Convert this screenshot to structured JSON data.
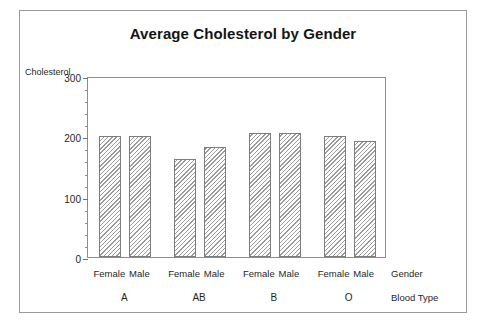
{
  "chart_data": {
    "type": "bar",
    "title": "Average Cholesterol by Gender",
    "xlabel": "Blood Type",
    "ylabel": "Cholesterol",
    "grid": false,
    "legend": "none",
    "ylim": [
      0,
      300
    ],
    "yticks": [
      0,
      100,
      200,
      300
    ],
    "ytick_labels": [
      "0",
      "100",
      "200",
      "300"
    ],
    "group_axis_name": "Blood Type",
    "subgroup_axis_name": "Gender",
    "categories": [
      "A",
      "AB",
      "B",
      "O"
    ],
    "subcategories": [
      "Female",
      "Male"
    ],
    "series": [
      {
        "name": "Female",
        "values": [
          200,
          163,
          205,
          200
        ]
      },
      {
        "name": "Male",
        "values": [
          201,
          183,
          206,
          193
        ]
      }
    ],
    "bars": [
      {
        "group": "A",
        "gender": "Female",
        "value": 200
      },
      {
        "group": "A",
        "gender": "Male",
        "value": 201
      },
      {
        "group": "AB",
        "gender": "Female",
        "value": 163
      },
      {
        "group": "AB",
        "gender": "Male",
        "value": 183
      },
      {
        "group": "B",
        "gender": "Female",
        "value": 205
      },
      {
        "group": "B",
        "gender": "Male",
        "value": 206
      },
      {
        "group": "O",
        "gender": "Female",
        "value": 200
      },
      {
        "group": "O",
        "gender": "Male",
        "value": 193
      }
    ],
    "colors": {
      "bar_fill": "#ffffff",
      "bar_hatch": "#9b9b9b",
      "bar_outline": "#7d7d7d",
      "axis": "#8d8d8d",
      "text": "#1f1f1f",
      "card_border": "#9a9a9a",
      "background": "#ffffff"
    }
  },
  "chart": {
    "title": "Average Cholesterol by Gender",
    "y_axis_title": "Cholesterol",
    "gender_axis_name": "Gender",
    "bloodtype_axis_name": "Blood Type"
  }
}
